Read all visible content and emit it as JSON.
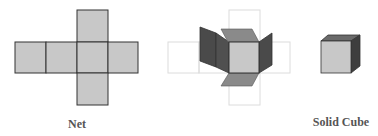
{
  "figures": [
    {
      "id": "net",
      "label": "Net"
    },
    {
      "id": "folding",
      "label": ""
    },
    {
      "id": "solid-cube",
      "label": "Solid Cube"
    }
  ],
  "colors": {
    "face_light": "#c8c8c8",
    "face_medium": "#8a8a8a",
    "face_dark": "#4a4a4a",
    "stroke": "#333333",
    "ghost_stroke": "#dcdcdc",
    "label": "#555555"
  }
}
